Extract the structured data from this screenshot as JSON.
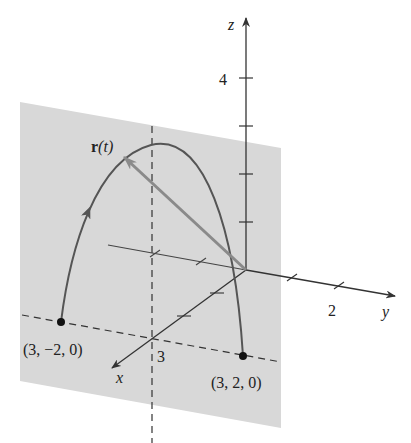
{
  "figure": {
    "type": "3d-vector-function-diagram",
    "vector_label": "r(t)",
    "vector_label_bold": "r",
    "vector_label_arg": "(t)",
    "axes": {
      "x": {
        "label": "x",
        "tick_label": "3"
      },
      "y": {
        "label": "y",
        "tick_label": "2"
      },
      "z": {
        "label": "z",
        "tick_label": "4"
      }
    },
    "points": [
      {
        "label": "(3, −2, 0)",
        "coords": [
          3,
          -2,
          0
        ]
      },
      {
        "label": "(3, 2, 0)",
        "coords": [
          3,
          2,
          0
        ]
      }
    ],
    "plane": {
      "description": "plane x = 3",
      "color": "#d6d6d6"
    },
    "curve_color": "#555555",
    "vector_color": "#8a8a8a",
    "axis_color": "#333333"
  }
}
